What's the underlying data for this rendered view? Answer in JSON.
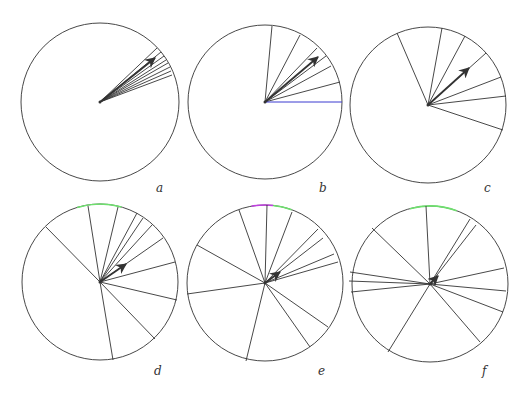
{
  "figure": {
    "colors": {
      "stroke": "#333333",
      "blue_line": "#3a3ad0",
      "green_arc": "#6ee06e",
      "magenta_arc": "#c040e0",
      "background": "#ffffff"
    },
    "panels": [
      {
        "id": "a",
        "label": "a",
        "label_pos": [
          160,
          193
        ],
        "center": [
          100,
          102
        ],
        "radius": 79,
        "lines": [
          [
            157,
            48
          ],
          [
            161,
            52
          ],
          [
            164,
            56
          ],
          [
            166,
            60
          ],
          [
            168,
            63
          ],
          [
            170,
            67
          ],
          [
            171,
            71
          ],
          [
            172,
            75
          ]
        ],
        "blue_lines": [],
        "arrow": [
          155,
          58
        ],
        "arcs": []
      },
      {
        "id": "b",
        "label": "b",
        "label_pos": [
          323,
          193
        ],
        "center": [
          265,
          102
        ],
        "radius": 77,
        "lines": [
          [
            272,
            26
          ],
          [
            300,
            35
          ],
          [
            317,
            48
          ],
          [
            326,
            56
          ],
          [
            331,
            66
          ],
          [
            340,
            82
          ]
        ],
        "blue_lines": [
          [
            342,
            102
          ]
        ],
        "arrow": [
          318,
          57
        ],
        "arcs": []
      },
      {
        "id": "c",
        "label": "c",
        "label_pos": [
          488,
          193
        ],
        "center": [
          428,
          105
        ],
        "radius": 78,
        "lines": [
          [
            397,
            33
          ],
          [
            442,
            28
          ],
          [
            465,
            36
          ],
          [
            486,
            53
          ],
          [
            501,
            77
          ],
          [
            506,
            96
          ],
          [
            503,
            130
          ]
        ],
        "blue_lines": [],
        "arrow": [
          469,
          68
        ],
        "arcs": []
      },
      {
        "id": "d",
        "label": "d",
        "label_pos": [
          158,
          376
        ],
        "center": [
          100,
          282
        ],
        "radius": 78,
        "lines": [
          [
            46,
            227
          ],
          [
            88,
            206
          ],
          [
            118,
            207
          ],
          [
            137,
            213
          ],
          [
            143,
            218
          ],
          [
            152,
            225
          ],
          [
            163,
            238
          ],
          [
            175,
            262
          ],
          [
            177,
            300
          ],
          [
            155,
            339
          ],
          [
            113,
            360
          ]
        ],
        "blue_lines": [],
        "arrow": [
          126,
          264
        ],
        "arcs": [
          {
            "from_deg": -107,
            "to_deg": -74,
            "color_key": "green_arc"
          }
        ]
      },
      {
        "id": "e",
        "label": "e",
        "label_pos": [
          322,
          376
        ],
        "center": [
          265,
          283
        ],
        "radius": 78,
        "lines": [
          [
            239,
            210
          ],
          [
            267,
            205
          ],
          [
            292,
            212
          ],
          [
            318,
            229
          ],
          [
            323,
            238
          ],
          [
            334,
            254
          ],
          [
            338,
            262
          ],
          [
            197,
            245
          ],
          [
            187,
            294
          ],
          [
            246,
            361
          ],
          [
            310,
            347
          ],
          [
            328,
            327
          ]
        ],
        "blue_lines": [],
        "arrow": [
          280,
          272
        ],
        "arcs": [
          {
            "from_deg": -100,
            "to_deg": -84,
            "color_key": "magenta_arc"
          },
          {
            "from_deg": -84,
            "to_deg": -70,
            "color_key": "green_arc"
          }
        ]
      },
      {
        "id": "f",
        "label": "f",
        "label_pos": [
          486,
          376
        ],
        "center": [
          430,
          284
        ],
        "radius": 78,
        "lines": [
          [
            426,
            206
          ],
          [
            470,
            219
          ],
          [
            476,
            225
          ],
          [
            504,
            268
          ],
          [
            506,
            291
          ],
          [
            503,
            312
          ],
          [
            480,
            342
          ],
          [
            388,
            352
          ],
          [
            372,
            228
          ],
          [
            350,
            272
          ],
          [
            349,
            281
          ],
          [
            351,
            292
          ]
        ],
        "blue_lines": [],
        "arrow": [
          438,
          276
        ],
        "arcs": [
          {
            "from_deg": -105,
            "to_deg": -70,
            "color_key": "green_arc"
          }
        ]
      }
    ]
  }
}
